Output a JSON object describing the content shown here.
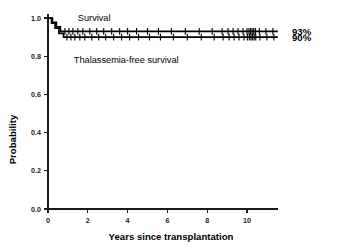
{
  "chart_data": {
    "type": "line",
    "title": "",
    "subtitle": "",
    "xlabel": "Years since transplantation",
    "ylabel": "Probability",
    "xlim": [
      -0.35,
      11.8
    ],
    "ylim": [
      0.0,
      1.04
    ],
    "xticks": [
      0,
      2,
      4,
      6,
      8,
      10
    ],
    "xticklabels": [
      "0",
      "2",
      "4",
      "6",
      "8",
      "10"
    ],
    "yticks": [
      0.0,
      0.2,
      0.4,
      0.6,
      0.8,
      1.0
    ],
    "yticklabels": [
      "0.0",
      "0.2",
      "0.4",
      "0.6",
      "0.8",
      "1.0"
    ],
    "grid": false,
    "legend_position": "inline-annotation",
    "series": [
      {
        "name": "Survival",
        "annotation_label": "Survival",
        "endpoint_label": "93%",
        "final_value": 0.93,
        "color": "#000000",
        "steps": [
          {
            "x": 0.0,
            "y": 1.0
          },
          {
            "x": 0.22,
            "y": 1.0
          },
          {
            "x": 0.22,
            "y": 0.977
          },
          {
            "x": 0.42,
            "y": 0.977
          },
          {
            "x": 0.42,
            "y": 0.954
          },
          {
            "x": 0.62,
            "y": 0.954
          },
          {
            "x": 0.62,
            "y": 0.93
          },
          {
            "x": 11.55,
            "y": 0.93
          }
        ],
        "censor_times": [
          0.85,
          1.05,
          1.25,
          1.5,
          1.75,
          2.1,
          2.45,
          2.8,
          3.2,
          3.6,
          4.0,
          4.45,
          5.0,
          5.55,
          6.2,
          6.9,
          7.6,
          8.25,
          8.75,
          9.05,
          9.3,
          9.55,
          9.8,
          10.0,
          10.1,
          10.18,
          10.26,
          10.34,
          10.42,
          10.62,
          10.95,
          11.3
        ]
      },
      {
        "name": "Thalassemia-free survival",
        "annotation_label": "Thalassemia-free survival",
        "endpoint_label": "90%",
        "final_value": 0.9,
        "color": "#000000",
        "steps": [
          {
            "x": 0.0,
            "y": 1.0
          },
          {
            "x": 0.18,
            "y": 1.0
          },
          {
            "x": 0.18,
            "y": 0.973
          },
          {
            "x": 0.36,
            "y": 0.973
          },
          {
            "x": 0.36,
            "y": 0.947
          },
          {
            "x": 0.55,
            "y": 0.947
          },
          {
            "x": 0.55,
            "y": 0.92
          },
          {
            "x": 0.78,
            "y": 0.92
          },
          {
            "x": 0.78,
            "y": 0.9
          },
          {
            "x": 11.55,
            "y": 0.9
          }
        ],
        "censor_times": [
          0.95,
          1.15,
          1.35,
          1.6,
          1.85,
          2.2,
          2.55,
          2.9,
          3.3,
          3.7,
          4.1,
          4.55,
          5.1,
          5.65,
          6.3,
          7.0,
          7.7,
          8.35,
          8.8,
          9.1,
          9.35,
          9.6,
          9.85,
          10.02,
          10.12,
          10.2,
          10.28,
          10.36,
          10.44,
          10.65,
          11.0,
          11.35
        ]
      }
    ],
    "annotations": [
      {
        "text": "Survival",
        "x": 1.5,
        "y": 1.0,
        "name": "survival-curve-label"
      },
      {
        "text": "Thalassemia-free survival",
        "x": 1.3,
        "y": 0.78,
        "name": "thalassemia-free-survival-curve-label"
      }
    ],
    "colors": {
      "curve": "#000000",
      "axis": "#1a1a1a",
      "background": "#ffffff"
    }
  }
}
